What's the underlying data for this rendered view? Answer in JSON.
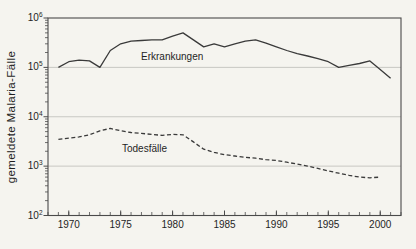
{
  "colors": {
    "background": "#f5f4ef",
    "line": "#3a3a3a",
    "grid": "#bdbdb8",
    "frame": "#4a4a4a",
    "text": "#1f1f1f"
  },
  "chart_data": {
    "type": "line",
    "title": "",
    "xlabel": "",
    "ylabel": "gemeldete Malaria-Fälle",
    "y_scale": "log",
    "xlim": [
      1968,
      2002
    ],
    "ylim": [
      100,
      1000000
    ],
    "x_major_ticks": [
      1970,
      1975,
      1980,
      1985,
      1990,
      1995,
      2000
    ],
    "x_minor_tick_step": 1,
    "y_major_ticks": [
      100,
      1000,
      10000,
      100000,
      1000000
    ],
    "y_gridlines": [
      1000,
      10000,
      100000
    ],
    "grid": "horizontal-decades",
    "legend_position": "inline-labels",
    "series": [
      {
        "name": "Erkrankungen",
        "style": "solid",
        "x": [
          1969,
          1970,
          1971,
          1972,
          1973,
          1974,
          1975,
          1976,
          1977,
          1978,
          1979,
          1980,
          1981,
          1982,
          1983,
          1984,
          1985,
          1986,
          1987,
          1988,
          1989,
          1990,
          1991,
          1992,
          1993,
          1994,
          1995,
          1996,
          1997,
          1998,
          1999,
          2000,
          2001
        ],
        "values": [
          100000,
          130000,
          140000,
          135000,
          100000,
          220000,
          300000,
          340000,
          350000,
          360000,
          360000,
          430000,
          500000,
          360000,
          260000,
          300000,
          260000,
          300000,
          340000,
          360000,
          310000,
          260000,
          220000,
          190000,
          170000,
          150000,
          130000,
          100000,
          110000,
          120000,
          135000,
          90000,
          60000
        ]
      },
      {
        "name": "Todesfälle",
        "style": "dashed",
        "x": [
          1969,
          1970,
          1971,
          1972,
          1973,
          1974,
          1975,
          1976,
          1977,
          1978,
          1979,
          1980,
          1981,
          1982,
          1983,
          1984,
          1985,
          1986,
          1987,
          1988,
          1989,
          1990,
          1991,
          1992,
          1993,
          1994,
          1995,
          1996,
          1997,
          1998,
          1999,
          2000
        ],
        "values": [
          3500,
          3700,
          3900,
          4300,
          5200,
          5800,
          5200,
          4800,
          4600,
          4400,
          4200,
          4400,
          4300,
          3100,
          2200,
          1900,
          1700,
          1600,
          1500,
          1450,
          1350,
          1300,
          1200,
          1100,
          1000,
          900,
          800,
          720,
          650,
          600,
          580,
          600
        ]
      }
    ]
  }
}
